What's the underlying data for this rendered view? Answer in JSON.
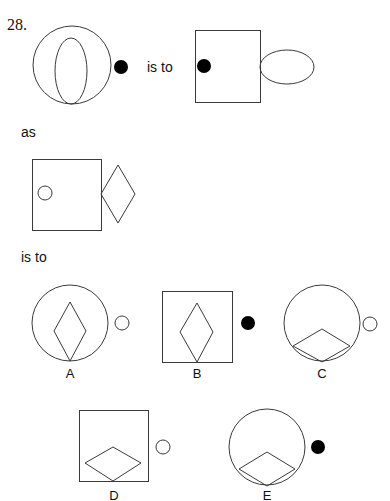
{
  "question": {
    "number": "28.",
    "connector_is_to_1": "is to",
    "connector_as": "as",
    "connector_is_to_2": "is to"
  },
  "figures": {
    "premise_1": {
      "outer": "circle",
      "inner": "ellipse (vertical, tangent bottom)",
      "outside": "black dot right"
    },
    "premise_2": {
      "outer": "square",
      "inner": "black dot left",
      "outside": "ellipse (horizontal) right"
    },
    "premise_3": {
      "outer": "square",
      "inner": "small white circle left",
      "outside": "diamond (vertical) right"
    }
  },
  "options": [
    {
      "label": "A",
      "outer": "circle",
      "inner": "vertical diamond",
      "outside": "white circle"
    },
    {
      "label": "B",
      "outer": "square",
      "inner": "vertical diamond",
      "outside": "black dot"
    },
    {
      "label": "C",
      "outer": "circle",
      "inner": "horizontal diamond at bottom",
      "outside": "white circle"
    },
    {
      "label": "D",
      "outer": "square",
      "inner": "horizontal diamond at bottom",
      "outside": "white circle"
    },
    {
      "label": "E",
      "outer": "circle",
      "inner": "horizontal diamond at bottom",
      "outside": "black dot"
    }
  ],
  "colors": {
    "stroke": "#3a3a3a",
    "fill_dot": "#000000",
    "background": "#ffffff"
  }
}
